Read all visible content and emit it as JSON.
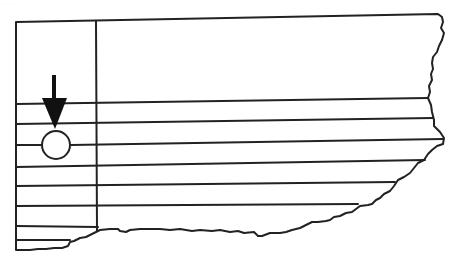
{
  "figure": {
    "caption_remnant": "····",
    "stroke_color": "#222222",
    "background": "#ffffff",
    "frame": {
      "left": 16,
      "top": 22,
      "divider_x": 96
    },
    "grid_lines_y": [
      104,
      124,
      145,
      167,
      186,
      206,
      226
    ],
    "marker": {
      "type": "circle",
      "cx": 56,
      "cy": 145,
      "r": 14
    },
    "arrow": {
      "direction": "down",
      "x": 54,
      "y_start": 75,
      "y_tip": 128
    }
  }
}
